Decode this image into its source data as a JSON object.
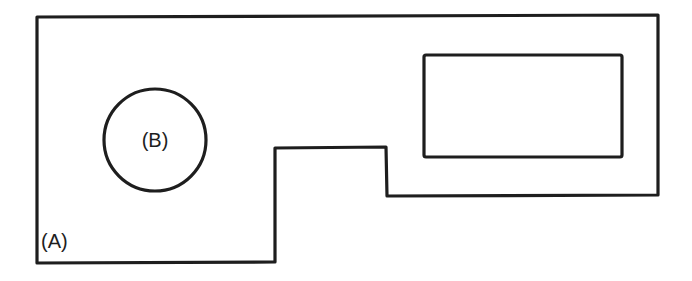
{
  "diagram": {
    "type": "plan-outline",
    "stroke_color": "#1e1e1e",
    "background_color": "#ffffff",
    "outer_shape": {
      "label": "(A)",
      "points": "37,17 658,15 658,195 387,196 386,147 275,148 275,262 37,263"
    },
    "circle": {
      "label": "(B)",
      "cx": 155,
      "cy": 140,
      "r": 51
    },
    "inner_rectangle": {
      "x": 424,
      "y": 55,
      "width": 198,
      "height": 102
    }
  }
}
